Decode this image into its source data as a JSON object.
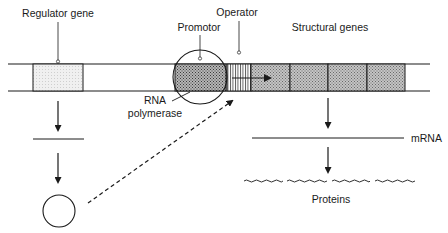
{
  "diagram": {
    "labels": {
      "regulator_gene": "Regulator gene",
      "promotor": "Promotor",
      "operator": "Operator",
      "structural_genes": "Structural genes",
      "rna": "RNA",
      "polymerase": "polymerase",
      "mrna": "mRNA",
      "proteins": "Proteins"
    },
    "colors": {
      "line": "#1a1a1a",
      "regulator_fill": "#ececec",
      "promotor_fill": "#8f8f8f",
      "structural_fill": "#a8a8a8",
      "background": "#ffffff"
    },
    "dna_segments": [
      "regulator",
      "spacer",
      "promotor",
      "operator",
      "structural-1",
      "structural-2",
      "structural-3",
      "structural-4"
    ],
    "protein_count": 4
  }
}
